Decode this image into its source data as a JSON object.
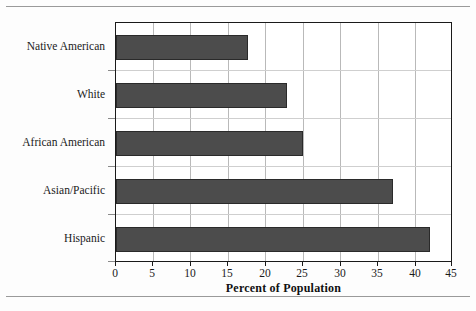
{
  "chart_data": {
    "type": "bar",
    "orientation": "horizontal",
    "title": "",
    "xlabel": "Percent of Population",
    "ylabel": "",
    "categories": [
      "Native American",
      "White",
      "African American",
      "Asian/Pacific",
      "Hispanic"
    ],
    "values": [
      17.7,
      22.8,
      25.0,
      37.0,
      42.0
    ],
    "xlim": [
      0,
      45
    ],
    "xticks": [
      0,
      5,
      10,
      15,
      20,
      25,
      30,
      35,
      40,
      45
    ],
    "xtick_labels": [
      "0",
      "5",
      "10",
      "15",
      "20",
      "25",
      "30",
      "35",
      "40",
      "45"
    ],
    "grid": true,
    "grid_axis": "x",
    "legend": false,
    "bar_color": "#4c4c4c",
    "bar_edge_color": "#2a2a2a",
    "plot_border_color": "#1a1a1a",
    "gridline_color": "#b9b9b9",
    "background_color": "#ffffff"
  }
}
